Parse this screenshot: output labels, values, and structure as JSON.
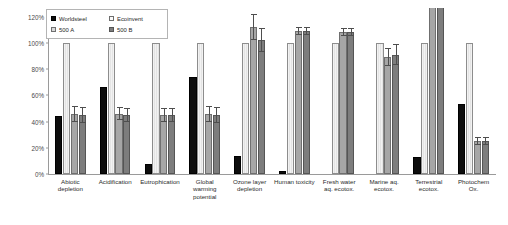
{
  "chart_data": {
    "type": "bar",
    "title": "",
    "xlabel": "",
    "ylabel": "",
    "ylim": [
      0,
      125
    ],
    "grid": false,
    "legend_position": "top-left",
    "ytick_labels": [
      "0%",
      "20%",
      "40%",
      "60%",
      "80%",
      "100%",
      "120%"
    ],
    "ytick_values": [
      0,
      20,
      40,
      60,
      80,
      100,
      120
    ],
    "categories": [
      "Abiotic depletion",
      "Acidification",
      "Eutrophication",
      "Global warming potential",
      "Ozone layer depletion",
      "Human toxicity",
      "Fresh water aq. ecotox.",
      "Marine aq. ecotox.",
      "Terrestrial ecotox.",
      "Photochem Ox."
    ],
    "category_lines": [
      [
        "Abiotic",
        "depletion"
      ],
      [
        "Acidification"
      ],
      [
        "Eutrophication"
      ],
      [
        "Global",
        "warming",
        "potential"
      ],
      [
        "Ozone layer",
        "depletion"
      ],
      [
        "Human toxicity"
      ],
      [
        "Fresh water",
        "aq. ecotox."
      ],
      [
        "Marine aq.",
        "ecotox."
      ],
      [
        "Terrestrial",
        "ecotox."
      ],
      [
        "Photochem",
        "Ox."
      ]
    ],
    "series": [
      {
        "name": "Worldsteel",
        "color": "#0d0d0d",
        "values": [
          44,
          66,
          8,
          74,
          14,
          2,
          0,
          0,
          13,
          53
        ],
        "errors": [
          0,
          0,
          0,
          0,
          0,
          0,
          0,
          0,
          0,
          0
        ]
      },
      {
        "name": "Ecoinvent",
        "color": "#efefef",
        "values": [
          100,
          100,
          100,
          100,
          100,
          100,
          100,
          100,
          100,
          100
        ],
        "errors": [
          0,
          0,
          0,
          0,
          0,
          0,
          0,
          0,
          0,
          0
        ]
      },
      {
        "name": "500 A",
        "color": "#a6a6a6",
        "values": [
          46,
          46,
          45,
          46,
          112,
          109,
          108,
          89,
          128,
          25
        ],
        "errors": [
          6,
          5,
          5,
          6,
          10,
          3,
          3,
          7,
          0,
          3
        ],
        "clipped": [
          false,
          false,
          false,
          false,
          false,
          false,
          false,
          false,
          true,
          false
        ]
      },
      {
        "name": "500 B",
        "color": "#7d7d7d",
        "values": [
          45,
          45,
          45,
          45,
          102,
          109,
          108,
          91,
          129,
          25
        ],
        "errors": [
          6,
          5,
          5,
          6,
          9,
          3,
          3,
          8,
          0,
          3
        ],
        "clipped": [
          false,
          false,
          false,
          false,
          false,
          false,
          false,
          false,
          true,
          false
        ]
      }
    ]
  },
  "legend": {
    "items": [
      {
        "label": "Worldsteel",
        "swatch": "sw-worldsteel"
      },
      {
        "label": "Ecoinvent",
        "swatch": "sw-ecoinvent"
      },
      {
        "label": "500 A",
        "swatch": "sw-500a"
      },
      {
        "label": "500 B",
        "swatch": "sw-500b"
      }
    ]
  }
}
